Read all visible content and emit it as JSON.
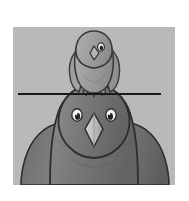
{
  "page": {
    "background_color": "#ffffff",
    "width": 189,
    "height": 201,
    "caption": ""
  },
  "illustration": {
    "title": "Two birds with a horizontal line",
    "alt_text": "A small bird perched on the head of a larger bird, with a straight horizontal line drawn across the picture at the point where they meet",
    "background_color": "#b9b9b9",
    "frame": {
      "left": 13,
      "top": 27,
      "width": 162,
      "height": 158
    },
    "subjects": [
      {
        "name": "upper-bird",
        "label": "Small bird (perched on top)",
        "body_color": "#a0a0a0",
        "outline_color": "#3a3a3a",
        "eye_color": "#ffffff",
        "beak_color": "#b4b4b4"
      },
      {
        "name": "lower-bird",
        "label": "Large bird (below)",
        "body_color": "#757575",
        "outline_color": "#2e2e2e",
        "eye_color": "#f2f2f2",
        "beak_color": "#c0c0c0"
      }
    ],
    "annotation_line": {
      "name": "horizontal-reference-line",
      "label": "Horizontal line",
      "color": "#1a1a1a",
      "thickness": 2,
      "x_start": 5,
      "x_end": 148,
      "y": 67
    }
  }
}
